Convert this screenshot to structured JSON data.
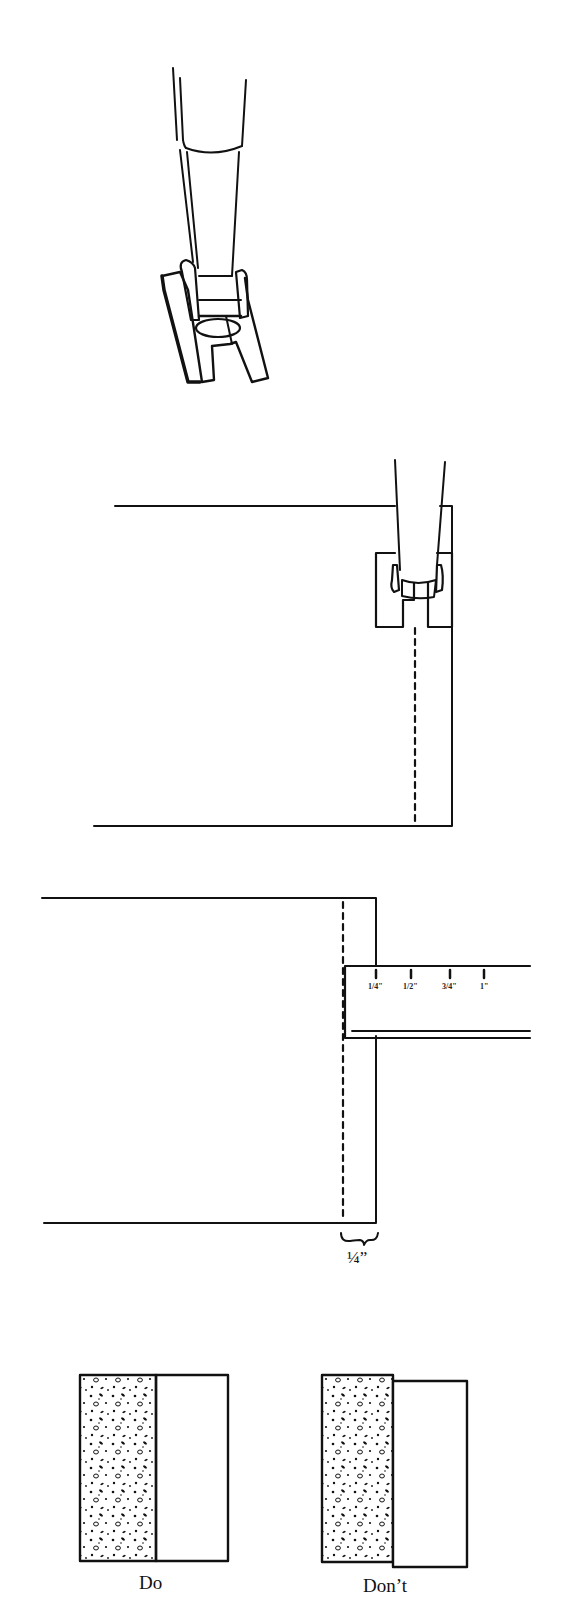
{
  "figures": [
    {
      "id": "presser-foot",
      "description": "Quarter-inch presser foot shown from front"
    },
    {
      "id": "foot-on-fabric",
      "description": "Presser foot aligned with fabric edge, dashed stitch line"
    },
    {
      "id": "ruler-measure",
      "description": "Fabric edge measured with ruler, quarter-inch seam allowance"
    },
    {
      "id": "do-dont",
      "description": "Comparison of aligned vs. misaligned seam"
    }
  ],
  "ruler": {
    "ticks": [
      "1/4\"",
      "1/2\"",
      "3/4\"",
      "1\""
    ]
  },
  "seam_allowance_label": "¼”",
  "comparison": {
    "do_label": "Do",
    "dont_label": "Don’t"
  },
  "colors": {
    "ink": "#111111",
    "background": "#ffffff"
  }
}
